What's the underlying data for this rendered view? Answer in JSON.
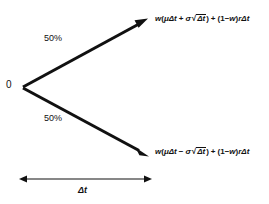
{
  "diagram": {
    "origin_label": "0",
    "branches": [
      {
        "id": "up",
        "probability_label": "50%",
        "outcome_plain": "w(μΔt + σ√Δt) + (1−w)rΔt",
        "parts": {
          "w1": "w",
          "paren_open": "(",
          "mu_dt": "μΔt",
          "sign": "+",
          "sigma": "σ",
          "radicand": "Δt",
          "paren_close": ")",
          "plus": "+",
          "one_minus_w": "(1−w)",
          "r_dt": "rΔt"
        }
      },
      {
        "id": "down",
        "probability_label": "50%",
        "outcome_plain": "w(μΔt − σ√Δt) + (1−w)rΔt",
        "parts": {
          "w1": "w",
          "paren_open": "(",
          "mu_dt": "μΔt",
          "sign": "−",
          "sigma": "σ",
          "radicand": "Δt",
          "paren_close": ")",
          "plus": "+",
          "one_minus_w": "(1−w)",
          "r_dt": "rΔt"
        }
      }
    ],
    "time_axis": {
      "label": "Δt",
      "arrow": "double-headed-horizontal-arrow"
    },
    "colors": {
      "background": "#ffffff",
      "ink": "#111111",
      "stroke": "#111111"
    }
  }
}
